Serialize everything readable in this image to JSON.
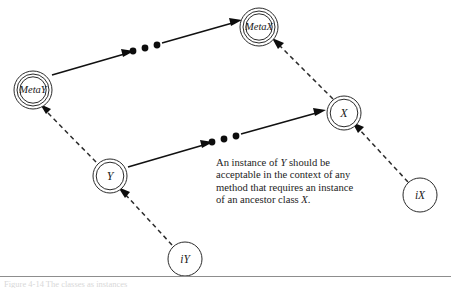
{
  "figure": {
    "kind": "uml-metaclass-instantiation-diagram",
    "background": "#ffffff",
    "ink_color": "#111111",
    "width": 451,
    "height": 290
  },
  "nodes": [
    {
      "id": "metax",
      "label": "MetaX",
      "style": "triple-circle",
      "role": "metaclass",
      "cx": 259,
      "cy": 27,
      "r": 19
    },
    {
      "id": "metay",
      "label": "MetaY",
      "style": "triple-circle",
      "role": "metaclass",
      "cx": 33,
      "cy": 90,
      "r": 19
    },
    {
      "id": "x",
      "label": "X",
      "style": "double-circle",
      "role": "class",
      "cx": 344,
      "cy": 113,
      "r": 17
    },
    {
      "id": "y",
      "label": "Y",
      "style": "double-circle",
      "role": "class",
      "cx": 110,
      "cy": 176,
      "r": 17
    },
    {
      "id": "ix",
      "label": "iX",
      "style": "single-circle",
      "role": "instance",
      "cx": 420,
      "cy": 195,
      "r": 17
    },
    {
      "id": "iy",
      "label": "iY",
      "style": "single-circle",
      "role": "instance",
      "cx": 185,
      "cy": 259,
      "r": 17
    }
  ],
  "edges": [
    {
      "id": "metay-to-metax",
      "from": "metay",
      "to": "metax",
      "style": "solid-with-ellipsis",
      "meaning": "inheritance-chain"
    },
    {
      "id": "y-to-x",
      "from": "y",
      "to": "x",
      "style": "solid-with-ellipsis",
      "meaning": "inheritance-chain"
    },
    {
      "id": "y-to-metay",
      "from": "y",
      "to": "metay",
      "style": "dashed",
      "meaning": "instance-of"
    },
    {
      "id": "x-to-metax",
      "from": "x",
      "to": "metax",
      "style": "dashed",
      "meaning": "instance-of"
    },
    {
      "id": "iy-to-y",
      "from": "iy",
      "to": "y",
      "style": "dashed",
      "meaning": "instance-of"
    },
    {
      "id": "ix-to-x",
      "from": "ix",
      "to": "x",
      "style": "dashed",
      "meaning": "instance-of"
    }
  ],
  "ellipsis": {
    "dot_count": 3,
    "upper": [
      {
        "x": 133,
        "y": 51
      },
      {
        "x": 144,
        "y": 48
      },
      {
        "x": 155,
        "y": 45
      }
    ],
    "lower": [
      {
        "x": 212,
        "y": 142
      },
      {
        "x": 223,
        "y": 139
      },
      {
        "x": 234,
        "y": 136
      }
    ]
  },
  "caption": {
    "lines": [
      {
        "before": "An instance of ",
        "italic": "Y",
        "after": " should be"
      },
      {
        "before": "acceptable in the context of any",
        "italic": "",
        "after": ""
      },
      {
        "before": "method that requires an instance",
        "italic": "",
        "after": ""
      },
      {
        "before": "of an ancestor class ",
        "italic": "X",
        "after": "."
      }
    ],
    "plain_text": "An instance of Y should be acceptable in the context of any method that requires an instance of an ancestor class X."
  },
  "footer": {
    "rule_color": "#8d8d8d",
    "cut_off_text": "Figure 4-14  The classes as instances"
  },
  "top_artifacts": "· · · ·"
}
